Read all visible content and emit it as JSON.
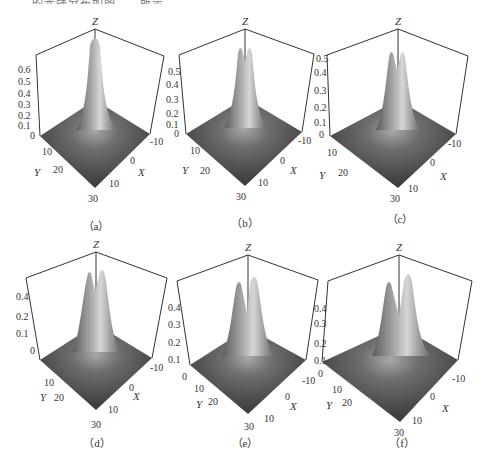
{
  "top_text_fragment": "……的光强分布如图……所示",
  "figure": {
    "panels": [
      {
        "id": "a",
        "caption": "（a）",
        "z_ticks": [
          "0",
          "0.1",
          "0.2",
          "0.3",
          "0.4",
          "0.5",
          "0.6"
        ],
        "peaks": 1,
        "peak_sep": 0,
        "zlabel": "Z",
        "xlabel": "X",
        "ylabel": "Y",
        "x_ticks": [
          "-10",
          "0",
          "10"
        ],
        "y_ticks": [
          "0",
          "10",
          "20",
          "30"
        ]
      },
      {
        "id": "b",
        "caption": "（b）",
        "z_ticks": [
          "0",
          "0.1",
          "0.2",
          "0.3",
          "0.4",
          "0.5"
        ],
        "peaks": 2,
        "peak_sep": 4,
        "zlabel": "Z",
        "xlabel": "X",
        "ylabel": "Y",
        "x_ticks": [
          "-10",
          "0",
          "10"
        ],
        "y_ticks": [
          "0",
          "10",
          "20",
          "30"
        ]
      },
      {
        "id": "c",
        "caption": "（c）",
        "z_ticks": [
          "0",
          "0.1",
          "0.2",
          "0.3",
          "0.4",
          "0.5"
        ],
        "peaks": 2,
        "peak_sep": 6,
        "zlabel": "Z",
        "xlabel": "X",
        "ylabel": "Y",
        "x_ticks": [
          "-10",
          "0",
          "10"
        ],
        "y_ticks": [
          "0",
          "10",
          "20",
          "30"
        ]
      },
      {
        "id": "d",
        "caption": "（d）",
        "z_ticks": [
          "0",
          "0.1",
          "0.2",
          "0.4"
        ],
        "peaks": 2,
        "peak_sep": 8,
        "zlabel": "Z",
        "xlabel": "X",
        "ylabel": "Y",
        "x_ticks": [
          "-10",
          "0",
          "10"
        ],
        "y_ticks": [
          "0",
          "10",
          "20",
          "30"
        ]
      },
      {
        "id": "e",
        "caption": "（e）",
        "z_ticks": [
          "0",
          "0.1",
          "0.2",
          "0.3",
          "0.4"
        ],
        "peaks": 2,
        "peak_sep": 11,
        "zlabel": "Z",
        "xlabel": "X",
        "ylabel": "Y",
        "x_ticks": [
          "-10",
          "0",
          "10"
        ],
        "y_ticks": [
          "0",
          "10",
          "20",
          "30"
        ]
      },
      {
        "id": "f",
        "caption": "（f）",
        "z_ticks": [
          "0",
          "0.1",
          "0.2",
          "0.3",
          "0.4"
        ],
        "peaks": 2,
        "peak_sep": 14,
        "zlabel": "Z",
        "xlabel": "X",
        "ylabel": "Y",
        "x_ticks": [
          "-10",
          "0",
          "10"
        ],
        "y_ticks": [
          "0",
          "10",
          "20",
          "30"
        ]
      }
    ]
  },
  "colors": {
    "surface_dark": "#4a4a4a",
    "surface_light": "#c8c8c8",
    "axis": "#333333",
    "background": "#ffffff"
  }
}
